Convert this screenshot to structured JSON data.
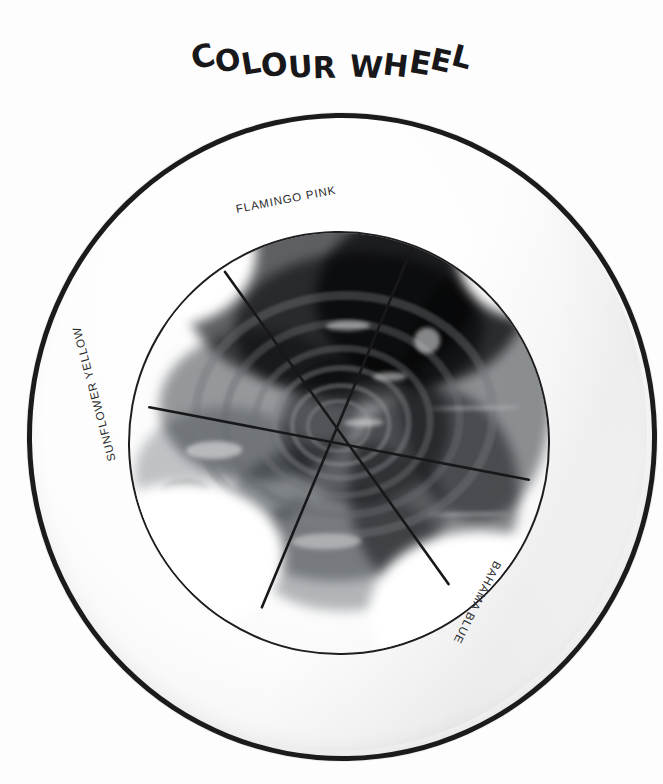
{
  "poster": {
    "title": "COLOUR WHEEL",
    "title_letters": [
      "C",
      "O",
      "L",
      "O",
      "U",
      "R",
      " ",
      "W",
      "H",
      "E",
      "E",
      "L"
    ],
    "background_color": "#ffffff",
    "ink_color": "#1b1b1d",
    "medium": "photograph of a white ceramic plate with hand-lettered annotations, greyscale"
  },
  "plate": {
    "rim_label": "outer plate rim",
    "well_label": "inner plate well",
    "rim_stroke_color": "#1b1b1d",
    "well_stroke_color": "#1e1e20",
    "fill_color": "#fdfdfd"
  },
  "wheel": {
    "segment_count": 6,
    "spoke_count": 3,
    "center": {
      "x": 209,
      "y": 197
    },
    "spokes": [
      {
        "name": "spoke-a",
        "x1": 100,
        "y1": 39,
        "x2": 318,
        "y2": 355
      },
      {
        "name": "spoke-b",
        "x1": 287,
        "y1": 19,
        "x2": 131,
        "y2": 375
      },
      {
        "name": "spoke-c",
        "x1": 22,
        "y1": 173,
        "x2": 400,
        "y2": 252
      }
    ],
    "labels": [
      {
        "id": "flamingo-pink",
        "text": "FLAMINGO PINK",
        "left": 236,
        "top": 203,
        "rotate": -11
      },
      {
        "id": "bahama-blue",
        "text": "BAHAMA BLUE",
        "left": 498,
        "top": 556,
        "rotate": 117
      },
      {
        "id": "sunflower-yellow",
        "text": "SUNFLOWER YELLOW",
        "left": 112,
        "top": 455,
        "rotate": -105
      }
    ]
  },
  "subject": {
    "description": "pile of crumpled dyed laundry arranged in a spiral on the plate",
    "tone_note": "darkest at the top, lightest toward the lower left"
  }
}
